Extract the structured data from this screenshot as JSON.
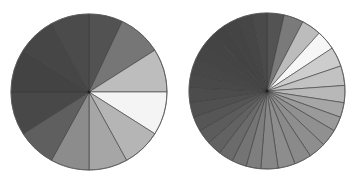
{
  "chart_data": [
    {
      "type": "pie",
      "title": "",
      "legend": [],
      "geometry": {
        "cx": 89,
        "cy": 92,
        "r": 78
      },
      "start_angle_deg": 0,
      "direction": "clockwise",
      "categories": [
        "s1",
        "s2",
        "s3",
        "s4",
        "s5",
        "s6",
        "s7",
        "s8",
        "s9",
        "s10",
        "s11",
        "s12"
      ],
      "values": [
        7,
        9,
        9,
        9,
        8,
        8,
        8,
        8,
        9,
        9,
        8,
        8
      ],
      "colors": [
        "#525252",
        "#767676",
        "#bdbdbd",
        "#f4f4f4",
        "#b5b5b5",
        "#a6a6a6",
        "#8c8c8c",
        "#5f5f5f",
        "#484848",
        "#434343",
        "#464646",
        "#4b4b4b"
      ]
    },
    {
      "type": "pie",
      "title": "",
      "legend": [],
      "geometry": {
        "cx": 267,
        "cy": 91,
        "r": 78
      },
      "start_angle_deg": 0,
      "direction": "clockwise",
      "categories": [
        "t1",
        "t2",
        "t3",
        "t4",
        "t5",
        "t6",
        "t7",
        "t8",
        "t9",
        "t10",
        "t11",
        "t12",
        "t13",
        "t14",
        "t15",
        "t16",
        "t17",
        "t18",
        "t19",
        "t20",
        "t21",
        "t22",
        "t23",
        "t24",
        "t25",
        "t26",
        "t27",
        "t28",
        "t29",
        "t30"
      ],
      "values": [
        3.5,
        4,
        4,
        4,
        4,
        4,
        3.5,
        3,
        3,
        3.5,
        3.5,
        3.5,
        3.5,
        3.5,
        3,
        3,
        3,
        3,
        3,
        3,
        3,
        3,
        3,
        3,
        3,
        3,
        3,
        3,
        3,
        3
      ],
      "colors": [
        "#535353",
        "#7a7a7a",
        "#bcbcbc",
        "#f6f6f6",
        "#cdcdcd",
        "#c2c2c2",
        "#b8b8b8",
        "#a6a6a6",
        "#9a9a9a",
        "#909090",
        "#8e8e8e",
        "#8a8a8a",
        "#8d8d8d",
        "#878787",
        "#7e7e7e",
        "#747474",
        "#6b6b6b",
        "#626262",
        "#5c5c5c",
        "#565656",
        "#505050",
        "#4c4c4c",
        "#494949",
        "#474747",
        "#454545",
        "#444444",
        "#434343",
        "#444444",
        "#464646",
        "#4a4a4a"
      ]
    }
  ]
}
